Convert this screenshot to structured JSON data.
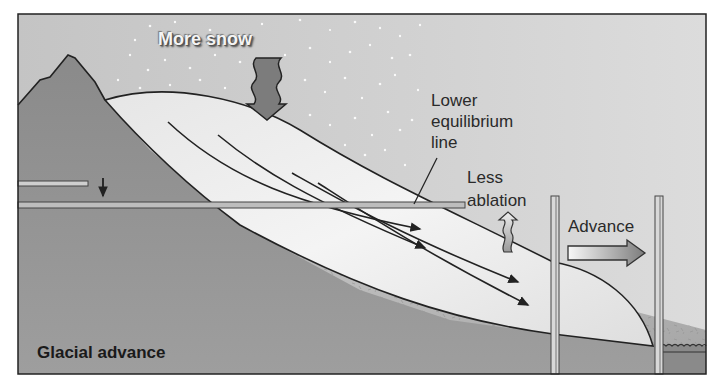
{
  "diagram": {
    "title": "Glacial advance",
    "labels": {
      "more_snow": "More snow",
      "lower_equilibrium_line": [
        "Lower",
        "equilibrium",
        "line"
      ],
      "less_ablation": [
        "Less",
        "ablation"
      ],
      "advance": "Advance"
    },
    "colors": {
      "sky": "#c9c9c9",
      "ground": "#b0b0b0",
      "mountain": "#8d8d8d",
      "ice": "#efefef",
      "snow_arrow": "#7a7a7a",
      "outline": "#222222",
      "water": "#6a6a6a"
    },
    "elements": [
      "mountain",
      "glacier",
      "snowfall",
      "more-snow-arrow",
      "old-equilibrium-line-marker",
      "lowering-arrow",
      "equilibrium-line",
      "ice-flow-arrows",
      "less-ablation-arrow",
      "advance-arrow",
      "reference-post-left",
      "reference-post-right",
      "lake"
    ]
  }
}
